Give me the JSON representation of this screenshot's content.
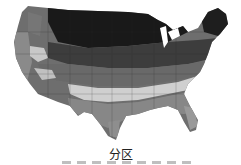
{
  "map": {
    "title": "分区",
    "region": "contiguous-united-states",
    "style": "grayscale-zone-map",
    "zone_colors": [
      "#111111",
      "#333333",
      "#555555",
      "#777777",
      "#999999",
      "#bbbbbb",
      "#dddddd"
    ]
  },
  "legend": {
    "swatch_count": 9,
    "swatch_color": "#bfbfbf"
  }
}
